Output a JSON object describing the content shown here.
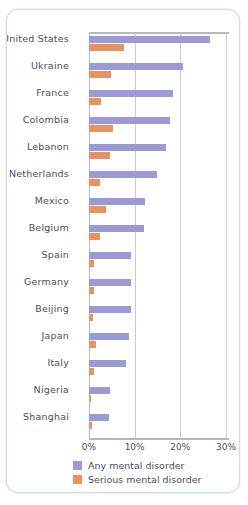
{
  "chart_data": {
    "type": "bar",
    "orientation": "horizontal",
    "title": "",
    "xlabel": "",
    "ylabel": "",
    "xlim": [
      0,
      30
    ],
    "xticks": [
      "0%",
      "10%",
      "20%",
      "30%"
    ],
    "xtick_values": [
      0,
      10,
      20,
      30
    ],
    "grid": true,
    "legend_position": "bottom",
    "categories": [
      "United States",
      "Ukraine",
      "France",
      "Colombia",
      "Lebanon",
      "Netherlands",
      "Mexico",
      "Belgium",
      "Spain",
      "Germany",
      "Beijing",
      "Japan",
      "Italy",
      "Nigeria",
      "Shanghai"
    ],
    "series": [
      {
        "name": "Any mental disorder",
        "color": "#9a9ad6",
        "values": [
          26.4,
          20.5,
          18.4,
          17.8,
          16.9,
          14.9,
          12.2,
          12.0,
          9.2,
          9.1,
          9.1,
          8.8,
          8.2,
          4.7,
          4.3
        ]
      },
      {
        "name": "Serious mental disorder",
        "color": "#e8935f",
        "values": [
          7.7,
          4.8,
          2.7,
          5.2,
          4.6,
          2.3,
          3.7,
          2.4,
          1.0,
          1.2,
          0.9,
          1.5,
          1.0,
          0.4,
          0.6
        ]
      }
    ]
  },
  "legend": {
    "items": [
      {
        "label": "Any mental disorder",
        "color": "#9a9ad6"
      },
      {
        "label": "Serious mental disorder",
        "color": "#e8935f"
      }
    ]
  },
  "axis": {
    "ticks": [
      {
        "label": "0%",
        "value": 0
      },
      {
        "label": "10%",
        "value": 10
      },
      {
        "label": "20%",
        "value": 20
      },
      {
        "label": "30%",
        "value": 30
      }
    ]
  }
}
